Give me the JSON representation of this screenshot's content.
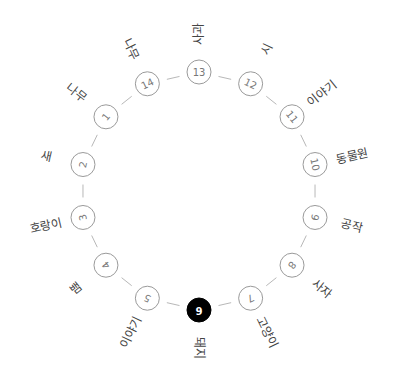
{
  "diagram": {
    "type": "circular-graph",
    "center": {
      "x": 199,
      "y": 191
    },
    "radius": 119,
    "label_radius": 157,
    "active_node": 6,
    "colors": {
      "edge": "#b8b8b8",
      "node_stroke": "#9a9a9a",
      "active_fill": "#000000",
      "text": "#444444"
    },
    "nodes": [
      {
        "id": 1,
        "label": "나무"
      },
      {
        "id": 2,
        "label": "새"
      },
      {
        "id": 3,
        "label": "호랑이"
      },
      {
        "id": 4,
        "label": "뱀"
      },
      {
        "id": 5,
        "label": "이야기"
      },
      {
        "id": 6,
        "label": "돼지"
      },
      {
        "id": 7,
        "label": "고양이"
      },
      {
        "id": 8,
        "label": "사자"
      },
      {
        "id": 9,
        "label": "공작"
      },
      {
        "id": 10,
        "label": "동물원"
      },
      {
        "id": 11,
        "label": "이야기"
      },
      {
        "id": 12,
        "label": "시"
      },
      {
        "id": 13,
        "label": "사과"
      },
      {
        "id": 14,
        "label": "나무"
      }
    ]
  }
}
